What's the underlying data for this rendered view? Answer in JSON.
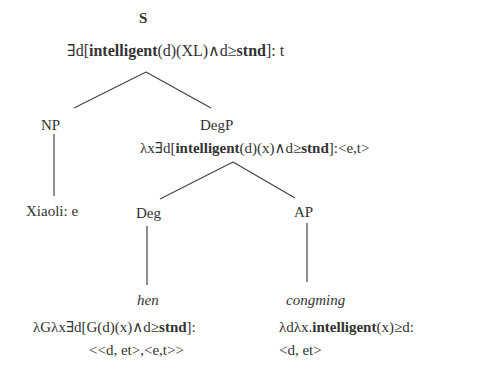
{
  "tree": {
    "root": {
      "category": "S",
      "sem": [
        {
          "t": "∃d[",
          "b": false
        },
        {
          "t": "intelligent",
          "b": true
        },
        {
          "t": "(d)(XL)∧d≥",
          "b": false
        },
        {
          "t": "stnd",
          "b": true
        },
        {
          "t": "]: t",
          "b": false
        }
      ]
    },
    "np": {
      "category": "NP",
      "leaf": "Xiaoli: e"
    },
    "degp": {
      "category": "DegP",
      "sem": [
        {
          "t": "λx∃d[",
          "b": false
        },
        {
          "t": "intelligent",
          "b": true
        },
        {
          "t": "(d)(x)∧d≥",
          "b": false
        },
        {
          "t": "stnd",
          "b": true
        },
        {
          "t": "]:<e,t>",
          "b": false
        }
      ]
    },
    "deg": {
      "category": "Deg",
      "word": "hen",
      "sem_line1": [
        {
          "t": "λGλx∃d[G(d)(x)∧d≥",
          "b": false
        },
        {
          "t": "stnd",
          "b": true
        },
        {
          "t": "]:",
          "b": false
        }
      ],
      "sem_line2": "<<d, et>,<e,t>>"
    },
    "ap": {
      "category": "AP",
      "word": "congming",
      "sem_line1": [
        {
          "t": "λdλx.",
          "b": false
        },
        {
          "t": "intelligent",
          "b": true
        },
        {
          "t": "(x)≥d:",
          "b": false
        }
      ],
      "sem_line2": "<d, et>"
    }
  },
  "colors": {
    "text": "#333333",
    "edges": "#444444",
    "background": "#ffffff"
  }
}
